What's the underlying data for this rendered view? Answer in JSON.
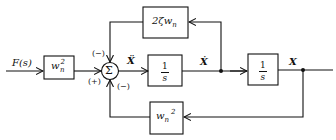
{
  "diagram": {
    "type": "block-diagram",
    "input_label": "F(s)",
    "blocks": {
      "input_gain": {
        "base": "w",
        "sub": "n",
        "sup": "2"
      },
      "damping": {
        "text": "2ζw",
        "sub": "n"
      },
      "integrator1": {
        "num": "1",
        "den": "s"
      },
      "integrator2": {
        "num": "1",
        "den": "s"
      },
      "stiffness": {
        "base": "w",
        "sub": "n",
        "sup": "2"
      }
    },
    "summer": {
      "symbol": "Σ",
      "sign_top": "(−)",
      "sign_left": "(+)",
      "sign_bottom": "(−)"
    },
    "signals": {
      "accel": "Ẍ",
      "vel": "Ẋ",
      "pos": "X"
    }
  }
}
